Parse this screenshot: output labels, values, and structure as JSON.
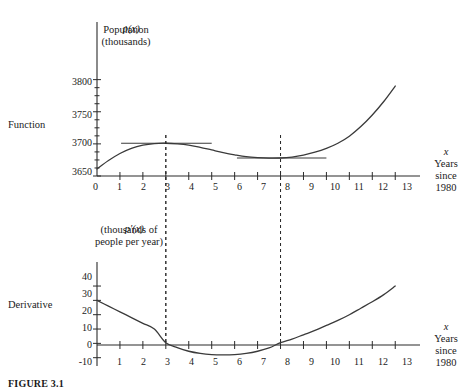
{
  "figure": {
    "caption": "FIGURE 3.1",
    "row_labels": {
      "function": "Function",
      "derivative": "Derivative"
    }
  },
  "chart_data": [
    {
      "type": "line",
      "id": "population-function",
      "title": "p(x)",
      "subtitle_line1": "Population",
      "subtitle_line2": "(thousands)",
      "ylabel": "Population (thousands)",
      "xlabel": "x",
      "xlabel_sub_line1": "Years",
      "xlabel_sub_line2": "since",
      "xlabel_sub_line3": "1980",
      "grid": false,
      "legend": "none",
      "xlim": [
        0,
        13.6
      ],
      "ylim": [
        3650,
        3815
      ],
      "xticks": [
        0,
        1,
        2,
        3,
        4,
        5,
        6,
        7,
        8,
        9,
        10,
        11,
        12,
        13
      ],
      "xtick_labels": [
        "0",
        "1",
        "2",
        "3",
        "4",
        "5",
        "6",
        "7",
        "8",
        "9",
        "10",
        "11",
        "12",
        "13"
      ],
      "yticks": [
        3650,
        3700,
        3750,
        3800
      ],
      "ytick_labels": [
        "3650",
        "3700",
        "3750",
        "3800"
      ],
      "yticks_minor": [
        3662.5,
        3675,
        3687.5,
        3712.5,
        3725,
        3737.5,
        3762.5,
        3775,
        3787.5
      ],
      "x": [
        0,
        0.5,
        1,
        1.5,
        2,
        2.5,
        3,
        3.5,
        4,
        4.5,
        5,
        5.5,
        6,
        6.5,
        7,
        7.5,
        8,
        8.5,
        9,
        9.5,
        10,
        10.5,
        11,
        11.5,
        12,
        12.5,
        13
      ],
      "values": [
        3661,
        3674,
        3685,
        3693,
        3698,
        3700.5,
        3701,
        3700,
        3698,
        3694.5,
        3690.5,
        3686.5,
        3683,
        3680,
        3678.5,
        3677.8,
        3678,
        3679.5,
        3682.5,
        3687,
        3693,
        3701,
        3712,
        3727,
        3745,
        3766,
        3790
      ],
      "annotations": [
        {
          "type": "horizontal-tangent",
          "label": "tangent at local maximum",
          "x_start": 1.05,
          "x_end": 5.0,
          "y": 3701
        },
        {
          "type": "horizontal-tangent",
          "label": "tangent at local minimum",
          "x_start": 6.1,
          "x_end": 10.0,
          "y": 3678
        },
        {
          "type": "dashed-vertical",
          "label": "critical point x = 3",
          "x": 3
        },
        {
          "type": "dashed-vertical",
          "label": "critical point x = 8",
          "x": 8
        }
      ]
    },
    {
      "type": "line",
      "id": "derivative-function",
      "title": "p'(x)",
      "subtitle_line1": "(thousands of",
      "subtitle_line2": "people per year)",
      "ylabel": "thousands of people per year",
      "xlabel": "x",
      "xlabel_sub_line1": "Years",
      "xlabel_sub_line2": "since",
      "xlabel_sub_line3": "1980",
      "grid": false,
      "legend": "none",
      "xlim": [
        0,
        13.6
      ],
      "ylim": [
        -13,
        47
      ],
      "xticks": [
        1,
        2,
        3,
        4,
        5,
        6,
        7,
        8,
        9,
        10,
        11,
        12,
        13
      ],
      "xtick_labels": [
        "1",
        "2",
        "3",
        "4",
        "5",
        "6",
        "7",
        "8",
        "9",
        "10",
        "11",
        "12",
        "13"
      ],
      "yticks": [
        -10,
        0,
        10,
        20,
        30,
        40
      ],
      "ytick_labels": [
        "-10",
        "0",
        "10",
        "20",
        "30",
        "40"
      ],
      "x": [
        0,
        0.5,
        1,
        1.5,
        2,
        2.5,
        3,
        3.5,
        4,
        4.5,
        5,
        5.5,
        6,
        6.5,
        7,
        7.5,
        8,
        8.5,
        9,
        9.5,
        10,
        10.5,
        11,
        11.5,
        12,
        12.5,
        13
      ],
      "values": [
        30,
        26,
        22,
        18,
        14,
        10,
        0.5,
        -3,
        -5.5,
        -7,
        -7.8,
        -8,
        -7.8,
        -7,
        -5.5,
        -3.2,
        0.5,
        3,
        6,
        9,
        12.5,
        16,
        20,
        24.5,
        29,
        34,
        40
      ],
      "annotations": [
        {
          "type": "dashed-vertical",
          "label": "zero of derivative x = 3",
          "x": 3
        },
        {
          "type": "dashed-vertical",
          "label": "zero of derivative x = 8",
          "x": 8
        }
      ]
    }
  ]
}
